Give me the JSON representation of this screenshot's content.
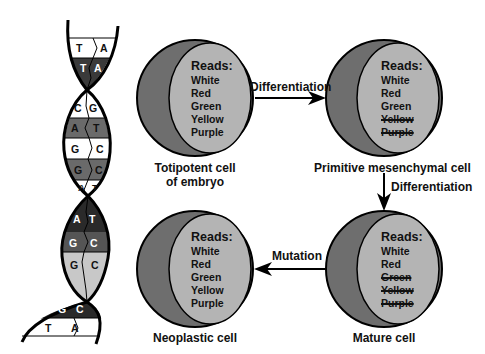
{
  "colors": {
    "cell_outer": "#6e6e6e",
    "cell_inner": "#b4b4b4",
    "dark_pair": "#2a2a2a",
    "mid_pair": "#6a6a6a",
    "light_pair": "#c8c8c8",
    "white_pair": "#ffffff"
  },
  "dna": {
    "base_pairs": [
      {
        "left": "T",
        "right": "A",
        "shade": "white"
      },
      {
        "left": "T",
        "right": "A",
        "shade": "dark"
      },
      {
        "left": "C",
        "right": "G",
        "shade": "white"
      },
      {
        "left": "A",
        "right": "T",
        "shade": "mid"
      },
      {
        "left": "G",
        "right": "C",
        "shade": "white"
      },
      {
        "left": "G",
        "right": "C",
        "shade": "mid"
      },
      {
        "left": "A",
        "right": "T",
        "shade": "white"
      },
      {
        "left": "A",
        "right": "T",
        "shade": "dark"
      },
      {
        "left": "G",
        "right": "C",
        "shade": "mid"
      },
      {
        "left": "G",
        "right": "C",
        "shade": "light"
      },
      {
        "left": "G",
        "right": "C",
        "shade": "dark"
      },
      {
        "left": "T",
        "right": "A",
        "shade": "white"
      }
    ]
  },
  "cells": [
    {
      "id": "totipotent",
      "caption_line1": "Totipotent cell",
      "caption_line2": "of embryo",
      "reads_title": "Reads:",
      "reads": [
        {
          "text": "White",
          "struck": false
        },
        {
          "text": "Red",
          "struck": false
        },
        {
          "text": "Green",
          "struck": false
        },
        {
          "text": "Yellow",
          "struck": false
        },
        {
          "text": "Purple",
          "struck": false
        }
      ]
    },
    {
      "id": "primitive-mesenchymal",
      "caption_line1": "Primitive mesenchymal cell",
      "caption_line2": "",
      "reads_title": "Reads:",
      "reads": [
        {
          "text": "White",
          "struck": false
        },
        {
          "text": "Red",
          "struck": false
        },
        {
          "text": "Green",
          "struck": false
        },
        {
          "text": "Yellow",
          "struck": true
        },
        {
          "text": "Purple",
          "struck": true
        }
      ]
    },
    {
      "id": "mature",
      "caption_line1": "Mature cell",
      "caption_line2": "",
      "reads_title": "Reads:",
      "reads": [
        {
          "text": "White",
          "struck": false
        },
        {
          "text": "Red",
          "struck": false
        },
        {
          "text": "Green",
          "struck": true
        },
        {
          "text": "Yellow",
          "struck": true
        },
        {
          "text": "Purple",
          "struck": true
        }
      ]
    },
    {
      "id": "neoplastic",
      "caption_line1": "Neoplastic cell",
      "caption_line2": "",
      "reads_title": "Reads:",
      "reads": [
        {
          "text": "White",
          "struck": false
        },
        {
          "text": "Red",
          "struck": false
        },
        {
          "text": "Green",
          "struck": false
        },
        {
          "text": "Yellow",
          "struck": false
        },
        {
          "text": "Purple",
          "struck": false
        }
      ]
    }
  ],
  "arrows": {
    "differentiation_1": "Differentiation",
    "differentiation_2": "Differentiation",
    "mutation": "Mutation"
  }
}
